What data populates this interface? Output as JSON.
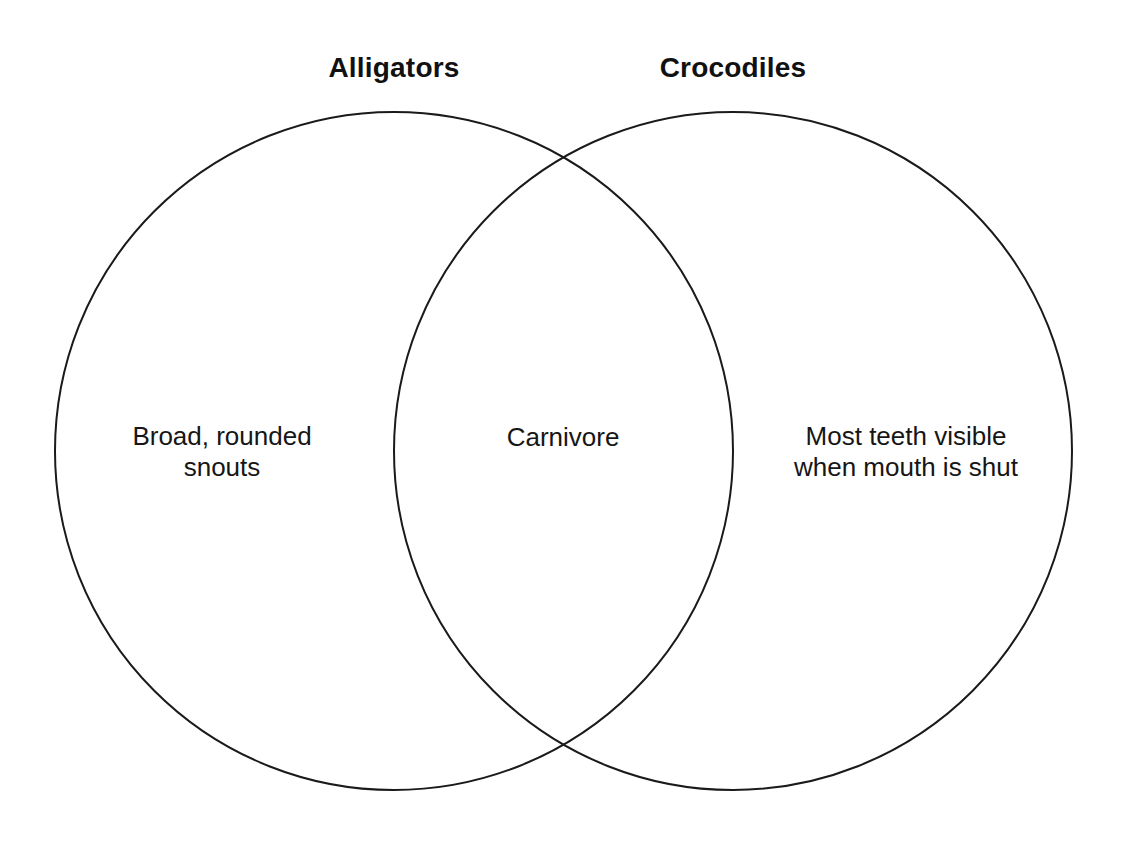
{
  "diagram": {
    "type": "venn",
    "background_color": "#ffffff",
    "stroke_color": "#1a1a1a",
    "stroke_width": 2,
    "sets": [
      {
        "id": "alligators",
        "title": "Alligators",
        "unique_label": "Broad, rounded\nsnouts",
        "circle": {
          "cx": 394,
          "cy": 451,
          "r": 339
        }
      },
      {
        "id": "crocodiles",
        "title": "Crocodiles",
        "unique_label": "Most teeth visible\nwhen mouth is shut",
        "circle": {
          "cx": 733,
          "cy": 451,
          "r": 339
        }
      }
    ],
    "intersection": {
      "label": "Carnivore",
      "crossing_points": [
        {
          "x": 563,
          "y": 147
        },
        {
          "x": 563,
          "y": 752
        }
      ]
    }
  }
}
